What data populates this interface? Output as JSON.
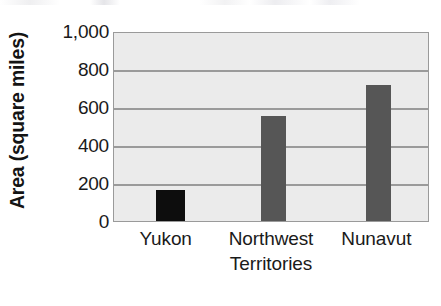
{
  "chart_data": {
    "type": "bar",
    "title": "",
    "subtitle": "",
    "xlabel": "",
    "ylabel": "Area (square miles)",
    "categories": [
      "Yukon",
      "Northwest Territories",
      "Nunavut"
    ],
    "values": [
      165,
      555,
      715
    ],
    "ylim": [
      0,
      1000
    ],
    "ytick_values": [
      0,
      200,
      400,
      600,
      800,
      1000
    ],
    "ytick_labels": [
      "0",
      "200",
      "400",
      "600",
      "800",
      "1,000"
    ],
    "grid": "horizontal",
    "legend": "none",
    "annotations": [],
    "bar_colors": [
      "#0d0d0d",
      "#565656",
      "#565656"
    ],
    "plot_background": "#ebebeb",
    "plot_border_color": "#9a9a9a",
    "gridline_color": "#9a9a9a",
    "bars": [
      {
        "category": "Yukon",
        "label_lines": [
          "Yukon"
        ],
        "value": 165,
        "color": "#0d0d0d"
      },
      {
        "category": "Northwest Territories",
        "label_lines": [
          "Northwest",
          "Territories"
        ],
        "value": 555,
        "color": "#565656"
      },
      {
        "category": "Nunavut",
        "label_lines": [
          "Nunavut"
        ],
        "value": 715,
        "color": "#565656"
      }
    ]
  }
}
